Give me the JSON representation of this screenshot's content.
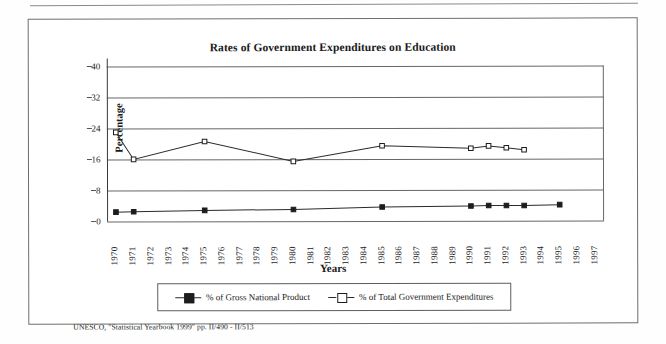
{
  "document": {
    "source_note": "UNESCO, \"Statistical Yearbook 1999\" pp. II/490 - II/513"
  },
  "chart_data": {
    "type": "line",
    "title": "Rates of Government Expenditures on Education",
    "xlabel": "Years",
    "ylabel": "Percentage",
    "ylim": [
      0,
      40
    ],
    "yticks": [
      0,
      8,
      16,
      24,
      32,
      40
    ],
    "grid": true,
    "legend_position": "bottom",
    "categories": [
      "1970",
      "1971",
      "1972",
      "1973",
      "1974",
      "1975",
      "1976",
      "1977",
      "1978",
      "1979",
      "1980",
      "1981",
      "1982",
      "1983",
      "1984",
      "1985",
      "1986",
      "1987",
      "1988",
      "1989",
      "1990",
      "1991",
      "1992",
      "1993",
      "1994",
      "1995",
      "1996",
      "1997"
    ],
    "series": [
      {
        "name": "% of Gross National Product",
        "marker": "filled-square",
        "points": [
          {
            "x": "1970",
            "y": 2.4
          },
          {
            "x": "1971",
            "y": 2.5
          },
          {
            "x": "1975",
            "y": 2.8
          },
          {
            "x": "1980",
            "y": 3.0
          },
          {
            "x": "1985",
            "y": 3.6
          },
          {
            "x": "1990",
            "y": 3.8
          },
          {
            "x": "1991",
            "y": 3.9
          },
          {
            "x": "1992",
            "y": 3.9
          },
          {
            "x": "1993",
            "y": 3.9
          },
          {
            "x": "1995",
            "y": 4.1
          }
        ]
      },
      {
        "name": "% of Total Government Expenditures",
        "marker": "open-square",
        "points": [
          {
            "x": "1970",
            "y": 23.0
          },
          {
            "x": "1971",
            "y": 16.0
          },
          {
            "x": "1975",
            "y": 20.6
          },
          {
            "x": "1980",
            "y": 15.4
          },
          {
            "x": "1985",
            "y": 19.4
          },
          {
            "x": "1990",
            "y": 18.7
          },
          {
            "x": "1991",
            "y": 19.3
          },
          {
            "x": "1992",
            "y": 18.8
          },
          {
            "x": "1993",
            "y": 18.3
          }
        ]
      }
    ]
  }
}
